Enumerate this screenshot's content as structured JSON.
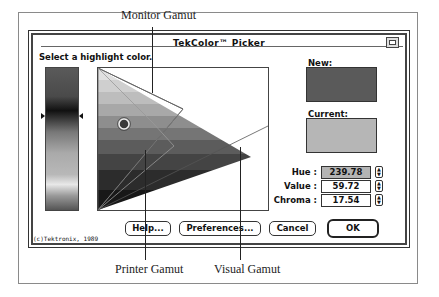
{
  "figure": {
    "callouts": {
      "monitor_gamut": "Monitor Gamut",
      "printer_gamut": "Printer Gamut",
      "visual_gamut": "Visual Gamut"
    }
  },
  "dialog": {
    "title": "TekColor™ Picker",
    "zoom_box_icon": "zoom-box-icon",
    "prompt": "Select a highlight color.",
    "new_label": "New:",
    "current_label": "Current:",
    "colors": {
      "new": "#5a5a5a",
      "current": "#b6b6b6"
    },
    "fields": [
      {
        "label": "Hue :",
        "value": "239.78",
        "selected": true
      },
      {
        "label": "Value :",
        "value": "59.72",
        "selected": false
      },
      {
        "label": "Chroma :",
        "value": "17.54",
        "selected": false
      }
    ],
    "buttons": {
      "help": "Help...",
      "preferences": "Preferences...",
      "cancel": "Cancel",
      "ok": "OK"
    },
    "copyright": "(c)Tektronix, 1989"
  }
}
